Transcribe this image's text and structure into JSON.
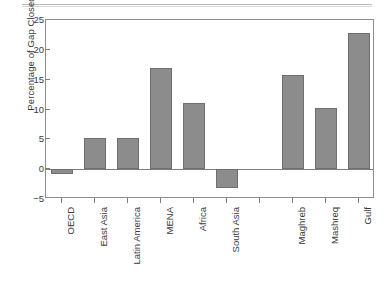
{
  "chart_data": {
    "type": "bar",
    "title": "",
    "xlabel": "",
    "ylabel": "Percentage of Gap Closed",
    "ylim": [
      -5,
      25
    ],
    "yticks": [
      -5,
      0,
      5,
      10,
      15,
      20,
      25
    ],
    "ytick_labels": [
      "−5",
      "0",
      "5",
      "10",
      "15",
      "20",
      "25"
    ],
    "grid": false,
    "legend": "none",
    "bar_color": "#8c8c8c",
    "bar_edge_color": "#6f6f6f",
    "axis_color": "#8d8d8d",
    "categories": [
      "OECD",
      "East Asia",
      "Latin America",
      "MENA",
      "Africa",
      "South Asia",
      "",
      "Maghreb",
      "Mashreq",
      "Gulf"
    ],
    "values": [
      -0.8,
      5.2,
      5.2,
      17.0,
      11.1,
      -3.2,
      null,
      15.8,
      10.2,
      22.8
    ],
    "series": [
      {
        "name": "Percentage of Gap Closed",
        "values": [
          -0.8,
          5.2,
          5.2,
          17.0,
          11.1,
          -3.2,
          null,
          15.8,
          10.2,
          22.8
        ]
      }
    ]
  }
}
